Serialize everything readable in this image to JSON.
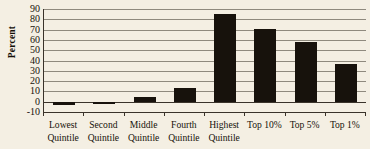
{
  "chart_data": {
    "type": "bar",
    "title": "",
    "xlabel": "",
    "ylabel": "Percent",
    "ylim": [
      -10,
      90
    ],
    "ytick_step": 10,
    "grid": true,
    "legend": "none",
    "bar_color": "#17120c",
    "background_color": "#f4efe3",
    "axis_color": "#3a332a",
    "gridline_color": "#8f8a7e",
    "categories": [
      "Lowest Quintile",
      "Second Quintile",
      "Middle Quintile",
      "Fourth Quintile",
      "Highest Quintile",
      "Top 10%",
      "Top 5%",
      "Top 1%"
    ],
    "category_lines": [
      [
        "Lowest",
        "Quintile"
      ],
      [
        "Second",
        "Quintile"
      ],
      [
        "Middle",
        "Quintile"
      ],
      [
        "Fourth",
        "Quintile"
      ],
      [
        "Highest",
        "Quintile"
      ],
      [
        "Top 10%",
        ""
      ],
      [
        "Top 5%",
        ""
      ],
      [
        "Top 1%",
        ""
      ]
    ],
    "values": [
      -3,
      -1,
      5,
      13,
      85,
      71,
      58,
      37
    ],
    "ytick_labels": [
      "90",
      "80",
      "70",
      "60",
      "50",
      "40",
      "30",
      "20",
      "10",
      "0",
      "-10"
    ],
    "ytick_values": [
      90,
      80,
      70,
      60,
      50,
      40,
      30,
      20,
      10,
      0,
      -10
    ]
  }
}
